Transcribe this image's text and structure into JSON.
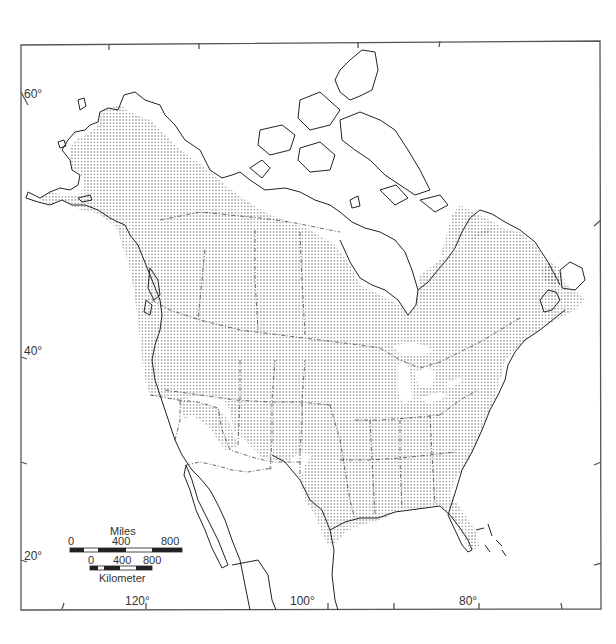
{
  "map": {
    "type": "species range map",
    "region": "North America",
    "colors": {
      "frame": "#555555",
      "coast": "#222222",
      "border": "#444444",
      "range_fill_dots": "#333333",
      "background": "#ffffff"
    },
    "latitude_labels": [
      {
        "text": "60°",
        "x": 26,
        "y": 93
      },
      {
        "text": "40°",
        "x": 26,
        "y": 348
      },
      {
        "text": "20°",
        "x": 26,
        "y": 552
      }
    ],
    "longitude_labels": [
      {
        "text": "120°",
        "x": 146,
        "y": 596
      },
      {
        "text": "100°",
        "x": 290,
        "y": 596
      },
      {
        "text": "80°",
        "x": 459,
        "y": 596
      }
    ],
    "scale_bar": {
      "miles": {
        "title": "Miles",
        "ticks": [
          "0",
          "400",
          "800"
        ]
      },
      "kilometers": {
        "title": "Kilometer",
        "ticks": [
          "0",
          "400",
          "800"
        ]
      }
    },
    "legend": {
      "stippled_area": "species range"
    }
  }
}
